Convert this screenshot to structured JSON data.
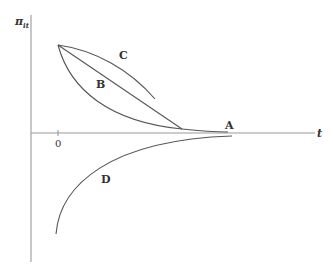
{
  "diagram": {
    "y_axis_label": "π",
    "y_axis_subscript": "it",
    "x_axis_label": "t",
    "origin_tick": "0",
    "curves": [
      {
        "id": "A",
        "label": "A",
        "description": "decays from origin point toward the t-axis, approaching zero"
      },
      {
        "id": "B",
        "label": "B",
        "description": "straight line from starting point down to the t-axis"
      },
      {
        "id": "C",
        "label": "C",
        "description": "concave curve from starting point, ending above the axis"
      },
      {
        "id": "D",
        "label": "D",
        "description": "negative branch rising toward zero from below the axis"
      }
    ],
    "colors": {
      "axis": "#9a9a9a",
      "curve": "#555555",
      "text": "#333333"
    }
  }
}
